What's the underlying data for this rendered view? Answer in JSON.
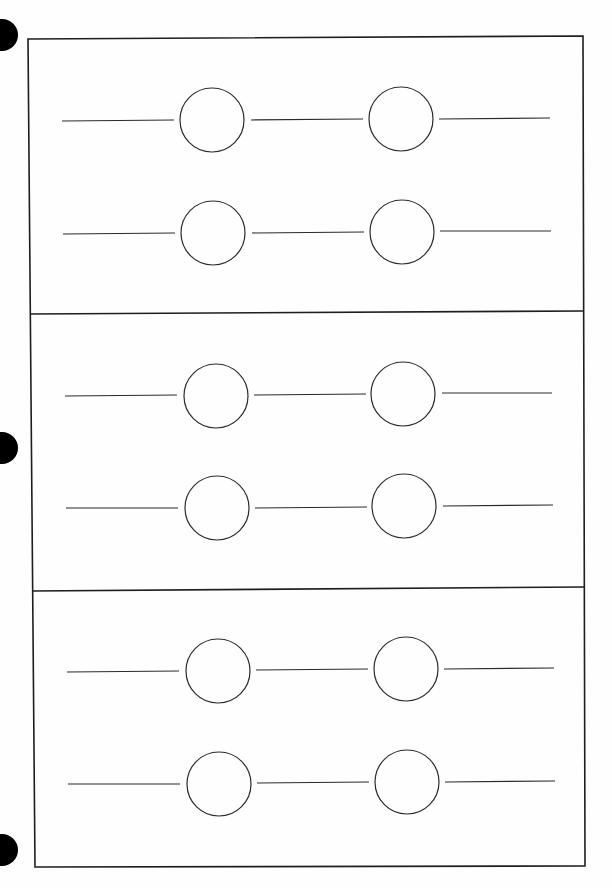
{
  "page": {
    "width": 612,
    "height": 888,
    "background": "#fefefe",
    "ink_color": "#2b2b2b",
    "frame_color": "#1e1e1e"
  },
  "punch_holes": [
    {
      "cx": 2,
      "cy": 35,
      "r": 16
    },
    {
      "cx": 2,
      "cy": 448,
      "r": 16
    },
    {
      "cx": 2,
      "cy": 850,
      "r": 16
    }
  ],
  "frame": {
    "top_left": [
      28,
      39
    ],
    "top_right": [
      583,
      36
    ],
    "bottom_right": [
      585,
      866
    ],
    "bottom_left": [
      35,
      867
    ],
    "stroke_width": 1.6
  },
  "dividers": [
    {
      "x1": 30,
      "y1": 314,
      "x2": 584,
      "y2": 311
    },
    {
      "x1": 32,
      "y1": 591,
      "x2": 585,
      "y2": 587
    }
  ],
  "panels": [
    {
      "name": "panel-1",
      "rows": [
        {
          "y": 120,
          "circles": [
            {
              "cx": 212,
              "cy": 120,
              "r": 32
            },
            {
              "cx": 401,
              "cy": 119,
              "r": 32
            }
          ],
          "lines": [
            [
              62,
              121,
              174,
              120
            ],
            [
              251,
              120,
              363,
              119
            ],
            [
              439,
              119,
              550,
              118
            ]
          ]
        },
        {
          "y": 233,
          "circles": [
            {
              "cx": 213,
              "cy": 233,
              "r": 32
            },
            {
              "cx": 402,
              "cy": 232,
              "r": 32
            }
          ],
          "lines": [
            [
              63,
              234,
              175,
              233
            ],
            [
              252,
              233,
              364,
              232
            ],
            [
              440,
              231,
              551,
              231
            ]
          ]
        }
      ]
    },
    {
      "name": "panel-2",
      "rows": [
        {
          "y": 395,
          "circles": [
            {
              "cx": 216,
              "cy": 396,
              "r": 32
            },
            {
              "cx": 403,
              "cy": 394,
              "r": 32
            }
          ],
          "lines": [
            [
              65,
              396,
              177,
              395
            ],
            [
              254,
              395,
              366,
              394
            ],
            [
              442,
              393,
              552,
              393
            ]
          ]
        },
        {
          "y": 507,
          "circles": [
            {
              "cx": 217,
              "cy": 508,
              "r": 32
            },
            {
              "cx": 404,
              "cy": 506,
              "r": 32
            }
          ],
          "lines": [
            [
              66,
              508,
              178,
              508
            ],
            [
              255,
              508,
              367,
              507
            ],
            [
              443,
              506,
              553,
              505
            ]
          ]
        }
      ]
    },
    {
      "name": "panel-3",
      "rows": [
        {
          "y": 671,
          "circles": [
            {
              "cx": 218,
              "cy": 671,
              "r": 32
            },
            {
              "cx": 406,
              "cy": 669,
              "r": 32
            }
          ],
          "lines": [
            [
              67,
              672,
              179,
              671
            ],
            [
              256,
              670,
              368,
              669
            ],
            [
              444,
              669,
              554,
              668
            ]
          ]
        },
        {
          "y": 783,
          "circles": [
            {
              "cx": 219,
              "cy": 784,
              "r": 32
            },
            {
              "cx": 407,
              "cy": 782,
              "r": 32
            }
          ],
          "lines": [
            [
              68,
              784,
              180,
              784
            ],
            [
              257,
              783,
              369,
              782
            ],
            [
              445,
              782,
              555,
              781
            ]
          ]
        }
      ]
    }
  ]
}
